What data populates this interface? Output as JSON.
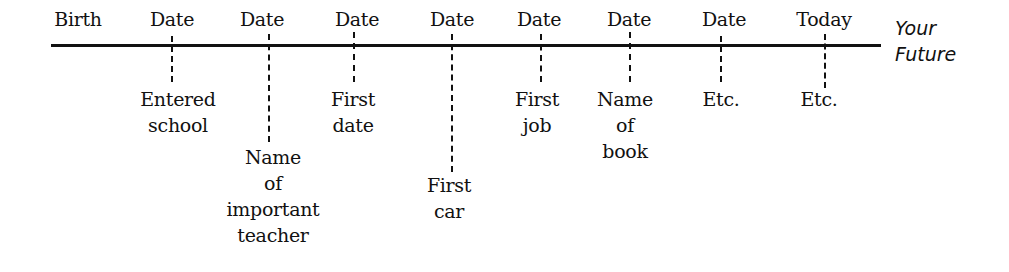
{
  "diagram": {
    "type": "timeline",
    "start_label": "Birth",
    "end_label_line1": "Your",
    "end_label_line2": "Future",
    "events": [
      {
        "top": "Date",
        "bottom": [
          "Entered",
          "school"
        ]
      },
      {
        "top": "Date",
        "bottom": [
          "Name",
          "of",
          "important",
          "teacher"
        ]
      },
      {
        "top": "Date",
        "bottom": [
          "First",
          "date"
        ]
      },
      {
        "top": "Date",
        "bottom": [
          "First",
          "car"
        ]
      },
      {
        "top": "Date",
        "bottom": [
          "First",
          "job"
        ]
      },
      {
        "top": "Date",
        "bottom": [
          "Name",
          "of",
          "book"
        ]
      },
      {
        "top": "Date",
        "bottom": [
          "Etc."
        ]
      },
      {
        "top": "Today",
        "bottom": [
          "Etc."
        ]
      }
    ]
  }
}
